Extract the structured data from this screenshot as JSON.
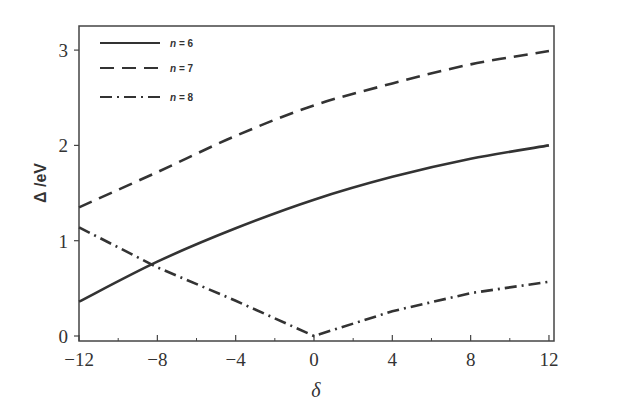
{
  "chart_data": {
    "type": "line",
    "title": "",
    "xlabel": "δ",
    "ylabel": "Δ /eV",
    "xlim": [
      -12,
      12
    ],
    "ylim": [
      0,
      3.1
    ],
    "xticks": [
      -12,
      -8,
      -4,
      0,
      4,
      8,
      12
    ],
    "xtick_labels": [
      "−12",
      "−8",
      "−4",
      "0",
      "4",
      "8",
      "12"
    ],
    "yticks": [
      0,
      1,
      2,
      3
    ],
    "ytick_labels": [
      "0",
      "1",
      "2",
      "3"
    ],
    "grid": false,
    "legend_position": "upper left",
    "x": [
      -12,
      -8,
      -4,
      0,
      4,
      8,
      12
    ],
    "series": [
      {
        "name": "n = 6",
        "style": "solid",
        "values": [
          0.36,
          0.78,
          1.13,
          1.43,
          1.67,
          1.86,
          2.0
        ]
      },
      {
        "name": "n = 7",
        "style": "dashed",
        "values": [
          1.35,
          1.72,
          2.1,
          2.42,
          2.65,
          2.85,
          2.99
        ]
      },
      {
        "name": "n = 8",
        "style": "dash-dot",
        "values": [
          1.14,
          0.72,
          0.37,
          0.0,
          0.26,
          0.45,
          0.57
        ]
      }
    ]
  },
  "legend": {
    "items": [
      {
        "var": "n",
        "rest": " = 6"
      },
      {
        "var": "n",
        "rest": " = 7"
      },
      {
        "var": "n",
        "rest": " = 8"
      }
    ]
  }
}
